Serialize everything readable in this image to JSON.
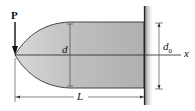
{
  "figure": {
    "colors": {
      "beam_fill": "#b9b9b9",
      "wall_shadow": "#9a9a9a",
      "line": "#222222"
    },
    "labels": {
      "load": "P",
      "depth": "d",
      "root_depth_base": "d",
      "root_depth_sub": "0",
      "axis": "x",
      "length": "L"
    }
  }
}
